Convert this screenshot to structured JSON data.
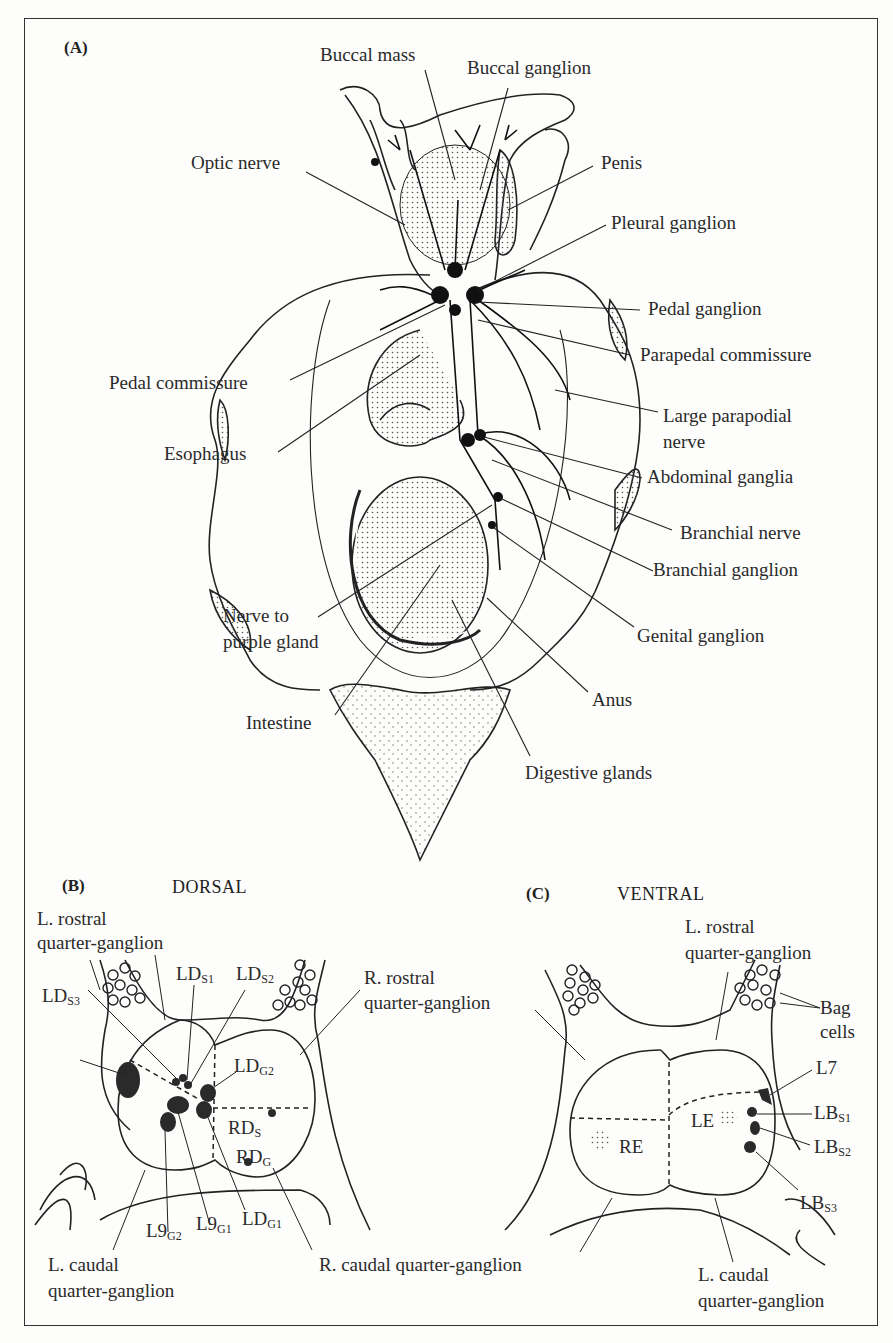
{
  "panels": {
    "A": {
      "tag": "(A)",
      "labels": {
        "buccal_mass": "Buccal mass",
        "buccal_ganglion": "Buccal ganglion",
        "optic_nerve": "Optic nerve",
        "penis": "Penis",
        "pleural_ganglion": "Pleural ganglion",
        "pedal_ganglion": "Pedal ganglion",
        "parapedal_commissure": "Parapedal commissure",
        "pedal_commissure": "Pedal commissure",
        "large_parapodial_nerve_1": "Large parapodial",
        "large_parapodial_nerve_2": "nerve",
        "esophagus": "Esophagus",
        "abdominal_ganglia": "Abdominal ganglia",
        "branchial_nerve": "Branchial nerve",
        "branchial_ganglion": "Branchial ganglion",
        "nerve_purple_1": "Nerve to",
        "nerve_purple_2": "purple gland",
        "genital_ganglion": "Genital ganglion",
        "anus": "Anus",
        "intestine": "Intestine",
        "digestive_glands": "Digestive glands"
      }
    },
    "B": {
      "tag": "(B)",
      "heading": "DORSAL",
      "labels": {
        "l_rostral_1": "L. rostral",
        "l_rostral_2": "quarter-ganglion",
        "r_rostral_1": "R. rostral",
        "r_rostral_2": "quarter-ganglion",
        "lds1": {
          "base": "LD",
          "sub": "S1"
        },
        "lds2": {
          "base": "LD",
          "sub": "S2"
        },
        "lds3": {
          "base": "LD",
          "sub": "S3"
        },
        "ldg2": {
          "base": "LD",
          "sub": "G2"
        },
        "ldg1": {
          "base": "LD",
          "sub": "G1"
        },
        "rds": {
          "base": "RD",
          "sub": "S"
        },
        "rdg": {
          "base": "RD",
          "sub": "G"
        },
        "l9g2": {
          "base": "L9",
          "sub": "G2"
        },
        "l9g1": {
          "base": "L9",
          "sub": "G1"
        },
        "l_caudal_1": "L. caudal",
        "l_caudal_2": "quarter-ganglion",
        "r_caudal": "R. caudal quarter-ganglion"
      }
    },
    "C": {
      "tag": "(C)",
      "heading": "VENTRAL",
      "labels": {
        "l_rostral_1": "L. rostral",
        "l_rostral_2": "quarter-ganglion",
        "bag_1": "Bag",
        "bag_2": "cells",
        "l7": "L7",
        "lbs1": {
          "base": "LB",
          "sub": "S1"
        },
        "lbs2": {
          "base": "LB",
          "sub": "S2"
        },
        "lbs3": {
          "base": "LB",
          "sub": "S3"
        },
        "le": "LE",
        "re": "RE",
        "l_caudal_1": "L. caudal",
        "l_caudal_2": "quarter-ganglion"
      }
    }
  }
}
